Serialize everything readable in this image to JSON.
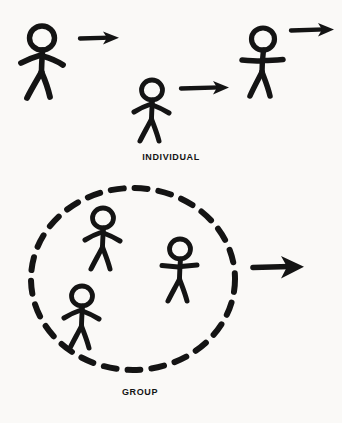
{
  "diagram": {
    "title_visible": false,
    "background_color": "#faf9f7",
    "ink_color": "#141414",
    "style": "hand-drawn stick figure sketch",
    "sections": [
      {
        "id": "individual",
        "label": "INDIVIDUAL",
        "label_x": 171,
        "label_y": 152,
        "description": "Three separate stick figures, each with its own arrow",
        "enclosure": "none",
        "figure_count": 3,
        "arrow_count": 3
      },
      {
        "id": "group",
        "label": "GROUP",
        "label_x": 140,
        "label_y": 387,
        "description": "Three stick figures enclosed in a dashed oval with one shared arrow",
        "enclosure": "dashed-oval",
        "figure_count": 3,
        "arrow_count": 1
      }
    ],
    "figures": [
      {
        "id": "individual-figure-1",
        "section": "individual",
        "cx": 42,
        "cy": 62,
        "scale": 1.0,
        "pose": "arms-down-out"
      },
      {
        "id": "individual-figure-2",
        "section": "individual",
        "cx": 152,
        "cy": 110,
        "scale": 0.82,
        "pose": "arms-down-out"
      },
      {
        "id": "individual-figure-3",
        "section": "individual",
        "cx": 263,
        "cy": 62,
        "scale": 0.92,
        "pose": "arms-out-level"
      },
      {
        "id": "group-figure-1",
        "section": "group",
        "cx": 103,
        "cy": 238,
        "scale": 0.8,
        "pose": "arms-down-out"
      },
      {
        "id": "group-figure-2",
        "section": "group",
        "cx": 180,
        "cy": 268,
        "scale": 0.8,
        "pose": "arms-out-level"
      },
      {
        "id": "group-figure-3",
        "section": "group",
        "cx": 82,
        "cy": 315,
        "scale": 0.8,
        "pose": "arms-down-out"
      }
    ],
    "arrows": [
      {
        "id": "individual-arrow-1",
        "section": "individual",
        "x1": 80,
        "y1": 38,
        "x2": 118,
        "y2": 38
      },
      {
        "id": "individual-arrow-2",
        "section": "individual",
        "x1": 181,
        "y1": 88,
        "x2": 228,
        "y2": 88
      },
      {
        "id": "individual-arrow-3",
        "section": "individual",
        "x1": 291,
        "y1": 30,
        "x2": 334,
        "y2": 30
      },
      {
        "id": "group-arrow",
        "section": "group",
        "x1": 253,
        "y1": 267,
        "x2": 303,
        "y2": 267
      }
    ],
    "oval": {
      "id": "group-oval",
      "cx": 133,
      "cy": 279,
      "rx": 102,
      "ry": 91,
      "stroke": "dashed",
      "dash_length": 13,
      "dash_gap": 11,
      "stroke_width": 6
    }
  }
}
